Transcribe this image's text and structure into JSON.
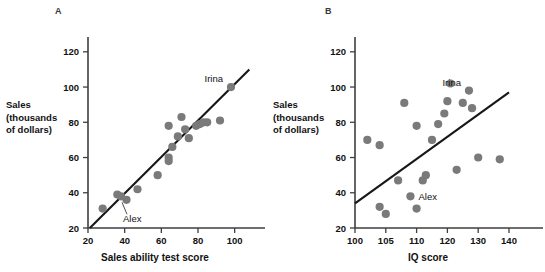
{
  "figure": {
    "panels": [
      {
        "id": "A",
        "letter": "A",
        "ylabel_lines": [
          "Sales",
          "(thousands",
          "of dollars)"
        ],
        "xlabel": "Sales ability test score",
        "annotations": [
          {
            "name": "Irina",
            "x": 98,
            "y": 100
          },
          {
            "name": "Alex",
            "x": 38,
            "y": 38
          }
        ]
      },
      {
        "id": "B",
        "letter": "B",
        "ylabel_lines": [
          "Sales",
          "(thousands",
          "of dollars)"
        ],
        "xlabel": "IQ score",
        "annotations": [
          {
            "name": "Irina",
            "x": 127,
            "y": 98
          },
          {
            "name": "Alex",
            "x": 109,
            "y": 38
          }
        ]
      }
    ]
  },
  "chart_data": [
    {
      "type": "scatter",
      "panel": "A",
      "title": "",
      "xlabel": "Sales ability test score",
      "ylabel": "Sales (thousands of dollars)",
      "xlim": [
        20,
        110
      ],
      "ylim": [
        20,
        125
      ],
      "xticks": [
        20,
        40,
        60,
        80,
        100
      ],
      "yticks": [
        20,
        40,
        60,
        80,
        100,
        120
      ],
      "grid": false,
      "legend": "none",
      "marker_color": "#7a7a7a",
      "points": [
        {
          "x": 28,
          "y": 31
        },
        {
          "x": 36,
          "y": 39
        },
        {
          "x": 38,
          "y": 38,
          "label": "Alex"
        },
        {
          "x": 41,
          "y": 36
        },
        {
          "x": 47,
          "y": 42
        },
        {
          "x": 58,
          "y": 50
        },
        {
          "x": 64,
          "y": 58
        },
        {
          "x": 64,
          "y": 60
        },
        {
          "x": 64,
          "y": 78
        },
        {
          "x": 66,
          "y": 66
        },
        {
          "x": 69,
          "y": 72
        },
        {
          "x": 71,
          "y": 83
        },
        {
          "x": 73,
          "y": 76
        },
        {
          "x": 75,
          "y": 71
        },
        {
          "x": 79,
          "y": 78
        },
        {
          "x": 81,
          "y": 79
        },
        {
          "x": 83,
          "y": 80
        },
        {
          "x": 85,
          "y": 80
        },
        {
          "x": 92,
          "y": 81
        },
        {
          "x": 98,
          "y": 100,
          "label": "Irina"
        }
      ],
      "fit_line": {
        "x1": 21,
        "y1": 20,
        "x2": 108,
        "y2": 110
      }
    },
    {
      "type": "scatter",
      "panel": "B",
      "title": "",
      "xlabel": "IQ score",
      "ylabel": "Sales (thousands of dollars)",
      "xlim": [
        100,
        142
      ],
      "ylim": [
        20,
        125
      ],
      "xticks": [
        100,
        105,
        110,
        120,
        130,
        140
      ],
      "yticks": [
        20,
        40,
        60,
        80,
        100,
        120
      ],
      "grid": false,
      "legend": "none",
      "marker_color": "#7a7a7a",
      "points": [
        {
          "x": 102,
          "y": 70
        },
        {
          "x": 104,
          "y": 32
        },
        {
          "x": 104,
          "y": 67
        },
        {
          "x": 105,
          "y": 28
        },
        {
          "x": 107,
          "y": 47
        },
        {
          "x": 108,
          "y": 91
        },
        {
          "x": 109,
          "y": 38,
          "label": "Alex"
        },
        {
          "x": 110,
          "y": 31
        },
        {
          "x": 110,
          "y": 78
        },
        {
          "x": 112,
          "y": 47
        },
        {
          "x": 113,
          "y": 50
        },
        {
          "x": 115,
          "y": 70
        },
        {
          "x": 117,
          "y": 79
        },
        {
          "x": 119,
          "y": 85
        },
        {
          "x": 120,
          "y": 92
        },
        {
          "x": 121,
          "y": 102
        },
        {
          "x": 123,
          "y": 53
        },
        {
          "x": 125,
          "y": 91
        },
        {
          "x": 127,
          "y": 98,
          "label": "Irina"
        },
        {
          "x": 128,
          "y": 88
        },
        {
          "x": 130,
          "y": 60
        },
        {
          "x": 137,
          "y": 59
        }
      ],
      "fit_line": {
        "x1": 100,
        "y1": 34,
        "x2": 140,
        "y2": 97
      }
    }
  ]
}
